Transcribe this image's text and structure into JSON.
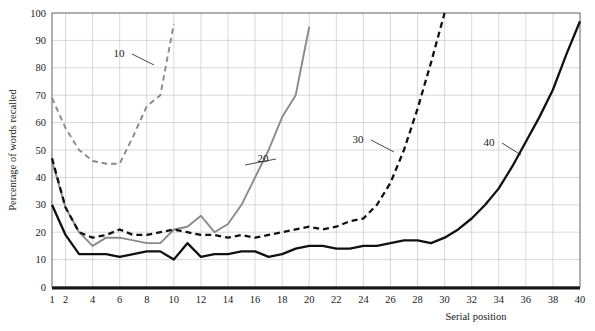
{
  "chart_data": {
    "type": "line",
    "title": "",
    "xlabel": "Serial position",
    "ylabel": "Percentage of words recalled",
    "xlim": [
      1,
      40
    ],
    "ylim": [
      0,
      100
    ],
    "grid": true,
    "legend_position": "inline-labels",
    "x_ticks": [
      1,
      2,
      4,
      6,
      8,
      10,
      12,
      14,
      16,
      18,
      20,
      22,
      24,
      26,
      28,
      30,
      32,
      34,
      36,
      38,
      40
    ],
    "x_tick_labels": [
      "1",
      "2",
      "4",
      "6",
      "8",
      "10",
      "12",
      "14",
      "16",
      "18",
      "20",
      "22",
      "24",
      "26",
      "28",
      "30",
      "32",
      "34",
      "36",
      "38",
      "40"
    ],
    "y_ticks": [
      0,
      10,
      20,
      30,
      40,
      50,
      60,
      70,
      80,
      90,
      100
    ],
    "y_tick_labels": [
      "0",
      "10",
      "20",
      "30",
      "40",
      "50",
      "60",
      "70",
      "80",
      "90",
      "100"
    ],
    "series": [
      {
        "name": "10",
        "label": "10",
        "color": "#8a8a8a",
        "style": "dashed",
        "width": 1.9,
        "x": [
          1,
          2,
          3,
          4,
          5,
          6,
          7,
          8,
          9,
          10
        ],
        "values": [
          69,
          58,
          50,
          46,
          45,
          45,
          55,
          66,
          70,
          96
        ]
      },
      {
        "name": "20",
        "label": "20",
        "color": "#8a8a8a",
        "style": "solid",
        "width": 1.9,
        "x": [
          1,
          2,
          3,
          4,
          5,
          6,
          7,
          8,
          9,
          10,
          11,
          12,
          13,
          14,
          15,
          16,
          17,
          18,
          19,
          20
        ],
        "values": [
          46,
          29,
          20,
          15,
          18,
          18,
          17,
          16,
          16,
          21,
          22,
          26,
          20,
          23,
          30,
          40,
          50,
          62,
          70,
          95
        ]
      },
      {
        "name": "30",
        "label": "30",
        "color": "#111111",
        "style": "dashed",
        "width": 2.3,
        "x": [
          1,
          2,
          3,
          4,
          5,
          6,
          7,
          8,
          9,
          10,
          11,
          12,
          13,
          14,
          15,
          16,
          17,
          18,
          19,
          20,
          21,
          22,
          23,
          24,
          25,
          26,
          27,
          28,
          29,
          30
        ],
        "values": [
          47,
          29,
          20,
          18,
          19,
          21,
          19,
          19,
          20,
          21,
          20,
          19,
          19,
          18,
          19,
          18,
          19,
          20,
          21,
          22,
          21,
          22,
          24,
          25,
          30,
          38,
          50,
          65,
          82,
          100
        ]
      },
      {
        "name": "40",
        "label": "40",
        "color": "#111111",
        "style": "solid",
        "width": 2.3,
        "x": [
          1,
          2,
          3,
          4,
          5,
          6,
          7,
          8,
          9,
          10,
          11,
          12,
          13,
          14,
          15,
          16,
          17,
          18,
          19,
          20,
          21,
          22,
          23,
          24,
          25,
          26,
          27,
          28,
          29,
          30,
          31,
          32,
          33,
          34,
          35,
          36,
          37,
          38,
          39,
          40
        ],
        "values": [
          30,
          19,
          12,
          12,
          12,
          11,
          12,
          13,
          13,
          10,
          16,
          11,
          12,
          12,
          13,
          13,
          11,
          12,
          14,
          15,
          15,
          14,
          14,
          15,
          15,
          16,
          17,
          17,
          16,
          18,
          21,
          25,
          30,
          36,
          44,
          53,
          62,
          72,
          85,
          97
        ]
      }
    ],
    "annotations": [
      {
        "text": "10",
        "series": "10",
        "label_x": 119,
        "label_y": 52,
        "point_x": 154,
        "point_y": 65
      },
      {
        "text": "20",
        "series": "20",
        "label_x": 263,
        "label_y": 157,
        "point_x": 245,
        "point_y": 165
      },
      {
        "text": "30",
        "series": "30",
        "label_x": 358,
        "label_y": 138,
        "point_x": 394,
        "point_y": 152
      },
      {
        "text": "40",
        "series": "40",
        "label_x": 489,
        "label_y": 141,
        "point_x": 521,
        "point_y": 155
      }
    ]
  }
}
